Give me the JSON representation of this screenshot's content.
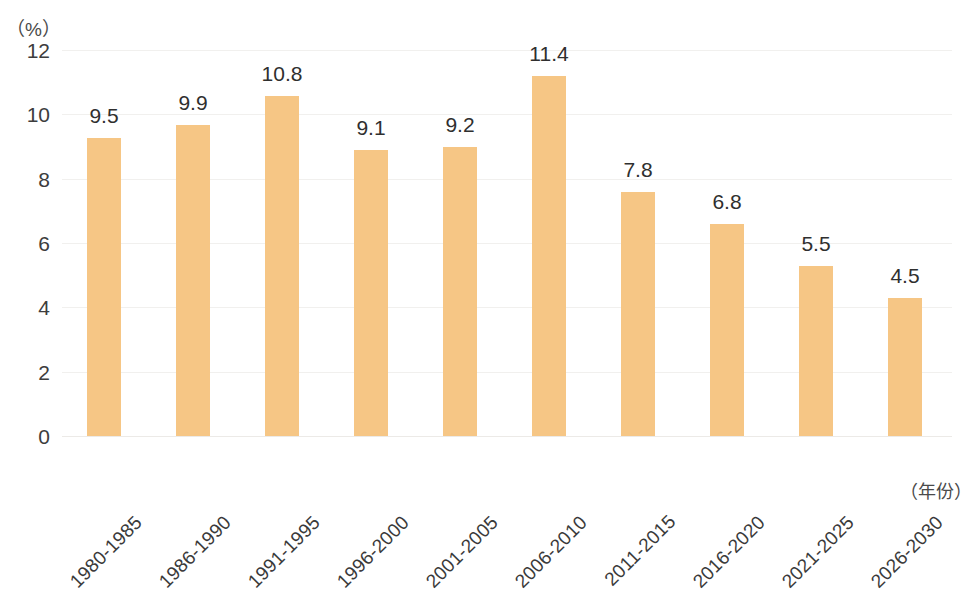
{
  "chart_data": {
    "type": "bar",
    "title": "",
    "subtitle": "",
    "xlabel": "（年份）",
    "ylabel": "（%）",
    "categories": [
      "1980-1985",
      "1986-1990",
      "1991-1995",
      "1996-2000",
      "2001-2005",
      "2006-2010",
      "2011-2015",
      "2016-2020",
      "2021-2025",
      "2026-2030"
    ],
    "values": [
      9.5,
      9.9,
      10.8,
      9.1,
      9.2,
      11.4,
      7.8,
      6.8,
      5.5,
      4.5
    ],
    "data_labels": [
      "9.5",
      "9.9",
      "10.8",
      "9.1",
      "9.2",
      "11.4",
      "7.8",
      "6.8",
      "5.5",
      "4.5"
    ],
    "ylim": [
      0,
      12
    ],
    "yticks": [
      0,
      2,
      4,
      6,
      8,
      10,
      12
    ],
    "ytick_labels": [
      "0",
      "2",
      "4",
      "6",
      "8",
      "10",
      "12"
    ],
    "grid": true,
    "grid_axis": "y",
    "legend": false,
    "legend_position": "none",
    "bar_color": "#F6C685",
    "text_color": "#3A3A3A",
    "gridline_color": "#F1F0EE",
    "background": "#FFFFFF",
    "xtick_rotation": -45
  }
}
